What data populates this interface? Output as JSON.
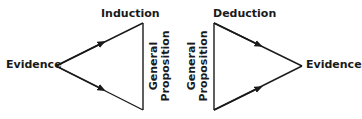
{
  "diagram": {
    "left": {
      "title": "Induction",
      "vertex_left": "Evidence",
      "side_label_line1": "General",
      "side_label_line2": "Proposition"
    },
    "right": {
      "title": "Deduction",
      "vertex_right": "Evidence",
      "side_label_line1": "General",
      "side_label_line2": "Proposition"
    },
    "stroke_color": "#1a1a1a"
  }
}
